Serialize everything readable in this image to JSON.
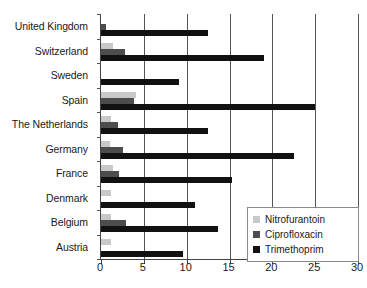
{
  "chart_data": {
    "type": "bar",
    "orientation": "horizontal",
    "title": "",
    "xlabel": "",
    "ylabel": "",
    "xlim": [
      0,
      30
    ],
    "xticks": [
      0,
      5,
      10,
      15,
      20,
      25,
      30
    ],
    "grid": "vertical",
    "legend_position": "bottom-right",
    "categories": [
      "United Kingdom",
      "Switzerland",
      "Sweden",
      "Spain",
      "The Netherlands",
      "Germany",
      "France",
      "Denmark",
      "Belgium",
      "Austria"
    ],
    "series": [
      {
        "name": "Nitrofurantoin",
        "color": "#c9c9c9",
        "values": [
          0,
          1.4,
          0,
          4.1,
          1.2,
          1.0,
          1.4,
          1.2,
          1.2,
          1.2
        ]
      },
      {
        "name": "Ciprofloxacin",
        "color": "#4d4d4d",
        "values": [
          0.6,
          2.8,
          0,
          3.9,
          2.0,
          2.6,
          2.1,
          0,
          2.9,
          0
        ]
      },
      {
        "name": "Trimethoprim",
        "color": "#111111",
        "values": [
          12.5,
          19.0,
          9.1,
          25.0,
          12.5,
          22.5,
          15.3,
          11.0,
          13.7,
          9.6
        ]
      }
    ]
  },
  "legend": {
    "items": [
      {
        "label": "Nitrofurantoin"
      },
      {
        "label": "Ciprofloxacin"
      },
      {
        "label": "Trimethoprim"
      }
    ]
  }
}
